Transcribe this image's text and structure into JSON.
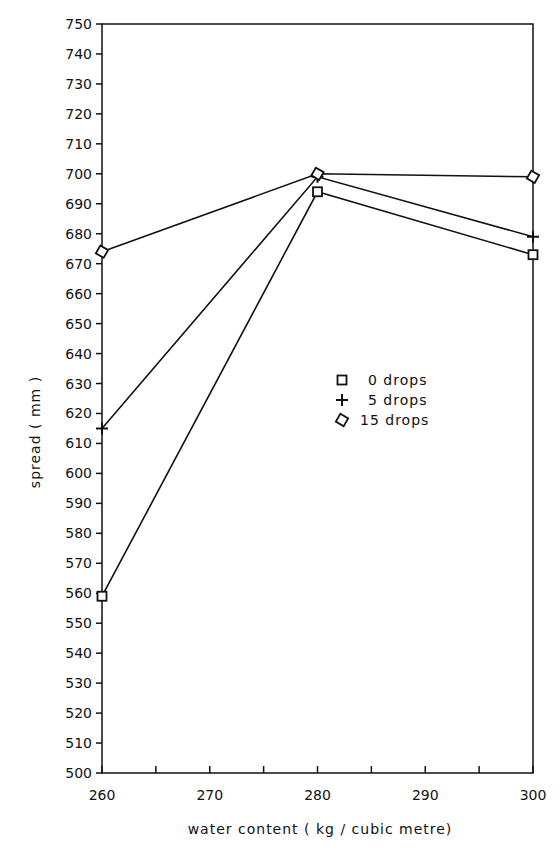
{
  "chart_data": {
    "type": "line",
    "title": "",
    "xlabel": "water content  ( kg / cubic metre)",
    "ylabel": "spread  ( mm )",
    "x": [
      260,
      280,
      300
    ],
    "xlim": [
      260,
      300
    ],
    "ylim": [
      500,
      750
    ],
    "x_ticks": [
      260,
      270,
      280,
      290,
      300
    ],
    "x_minor_ticks": [
      265,
      275,
      285,
      295
    ],
    "y_ticks": [
      500,
      510,
      520,
      530,
      540,
      550,
      560,
      570,
      580,
      590,
      600,
      610,
      620,
      630,
      640,
      650,
      660,
      670,
      680,
      690,
      700,
      710,
      720,
      730,
      740,
      750
    ],
    "grid": false,
    "legend_position": "center-right (inside plot)",
    "series": [
      {
        "name": "0 drops",
        "marker": "square",
        "values": [
          559,
          694,
          673
        ]
      },
      {
        "name": "5 drops",
        "marker": "plus",
        "values": [
          615,
          699,
          679
        ]
      },
      {
        "name": "15 drops",
        "marker": "diamond",
        "values": [
          674,
          700,
          699
        ]
      }
    ]
  },
  "colors": {
    "ink": "#111111",
    "background": "#ffffff"
  }
}
